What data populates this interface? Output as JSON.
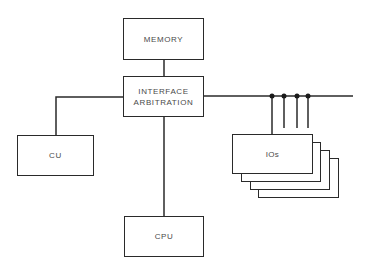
{
  "diagram": {
    "type": "block-diagram",
    "blocks": {
      "memory": {
        "label": "MEMORY"
      },
      "interface": {
        "line1": "INTERFACE",
        "line2": "ARBITRATION"
      },
      "cu": {
        "label": "CU"
      },
      "cpu": {
        "label": "CPU"
      },
      "ios": {
        "label": "IOs",
        "stack_count": 4
      }
    },
    "connections": [
      {
        "from": "MEMORY",
        "to": "INTERFACE ARBITRATION"
      },
      {
        "from": "INTERFACE ARBITRATION",
        "to": "CU"
      },
      {
        "from": "INTERFACE ARBITRATION",
        "to": "CPU"
      },
      {
        "from": "INTERFACE ARBITRATION",
        "to": "bus"
      },
      {
        "from": "bus",
        "to": "IOs",
        "taps": 4
      }
    ],
    "colors": {
      "line": "#2a2a2a",
      "text": "#4a4a4a",
      "background": "#ffffff"
    }
  }
}
